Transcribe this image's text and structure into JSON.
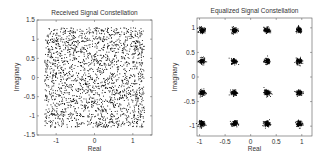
{
  "chart_data": [
    {
      "type": "scatter",
      "title": "Received Signal Constellation",
      "xlabel": "Real",
      "ylabel": "Imaginary",
      "xlim": [
        -1.5,
        1.5
      ],
      "ylim": [
        -1.5,
        1.5
      ],
      "xticks": [
        -1,
        0,
        1
      ],
      "xtick_labels": [
        "-1",
        "0",
        "1"
      ],
      "yticks": [
        -1.5,
        -1,
        -0.5,
        0,
        0.5,
        1,
        1.5
      ],
      "ytick_labels": [
        "-1.5",
        "-1",
        "-0.5",
        "0",
        "0.5",
        "1",
        "1.5"
      ],
      "grid": false,
      "description": "Dense cloud of ~2000 noisy received symbols roughly uniformly spread over [-1.3,1.3] x [-1.3,1.3]",
      "point_spread": {
        "xmin": -1.3,
        "xmax": 1.3,
        "ymin": -1.3,
        "ymax": 1.3,
        "count": 2000
      },
      "marker_color": "#000000"
    },
    {
      "type": "scatter",
      "title": "Equalized Signal Constellation",
      "xlabel": "Real",
      "ylabel": "Imaginary",
      "xlim": [
        -1.05,
        1.2
      ],
      "ylim": [
        -1.2,
        1.2
      ],
      "xticks": [
        -1,
        -0.5,
        0,
        0.5,
        1
      ],
      "xtick_labels": [
        "-1",
        "-0.5",
        "0",
        "0.5",
        "1"
      ],
      "yticks": [
        -1,
        -0.5,
        0,
        0.5,
        1
      ],
      "ytick_labels": [
        "-1",
        "-0.5",
        "0",
        "0.5",
        "1"
      ],
      "grid": false,
      "description": "16-QAM constellation: 16 tight clusters",
      "cluster_centers_x": [
        -0.95,
        -0.32,
        0.32,
        0.95
      ],
      "cluster_centers_y": [
        -0.95,
        -0.32,
        0.32,
        0.95
      ],
      "cluster_spread": 0.05,
      "points_per_cluster": 120,
      "marker_color": "#000000"
    }
  ]
}
